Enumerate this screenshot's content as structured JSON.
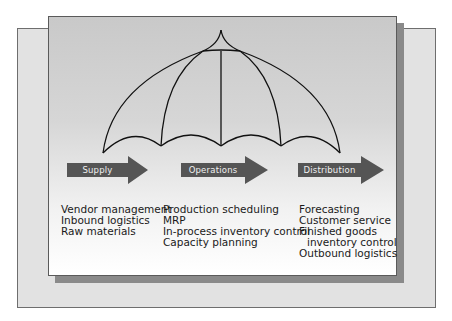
{
  "diagram": {
    "colors": {
      "back_panel": "#e2e2e2",
      "front_panel_top": "#c9c9c9",
      "front_panel_bottom": "#ffffff",
      "shadow": "#8a8a8a",
      "arrow": "#555555",
      "umbrella_line": "#111111"
    },
    "umbrella": {
      "ribs": 5,
      "description": "umbrella spanning all three stages"
    },
    "stages": [
      {
        "label": "Supply",
        "items": [
          "Vendor management",
          "Inbound logistics",
          "Raw materials"
        ]
      },
      {
        "label": "Operations",
        "items": [
          "Production scheduling",
          "MRP",
          "In-process inventory control",
          "Capacity planning"
        ]
      },
      {
        "label": "Distribution",
        "items": [
          "Forecasting",
          "Customer service",
          "Finished goods",
          "inventory control",
          "Outbound logistics"
        ]
      }
    ]
  }
}
